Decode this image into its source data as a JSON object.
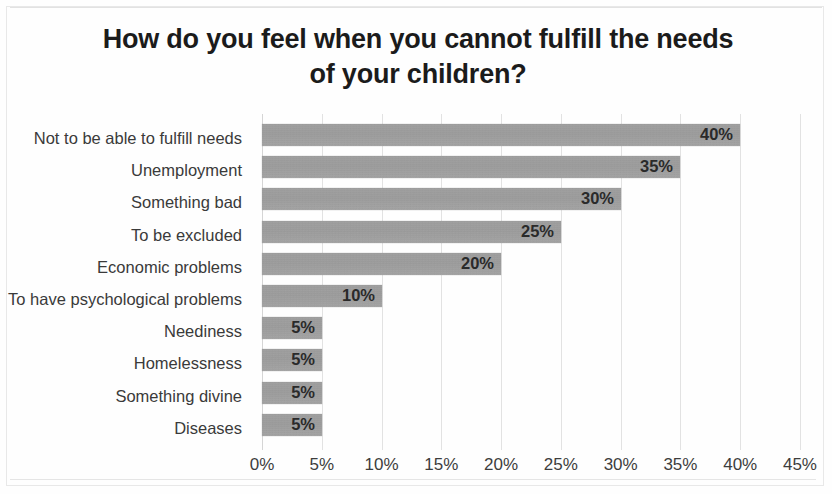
{
  "chart_data": {
    "type": "bar",
    "orientation": "horizontal",
    "title": "How do you feel when you cannot fulfill the needs of your children?",
    "title_lines": [
      "How do you feel when you cannot fulfill the needs",
      "of your children?"
    ],
    "xlabel": "",
    "ylabel": "",
    "xlim": [
      0,
      45
    ],
    "grid": true,
    "legend": false,
    "bar_color": "#9b9b9b",
    "categories": [
      "Not to be able to fulfill needs",
      "Unemployment",
      "Something bad",
      "To be excluded",
      "Economic problems",
      "To have psychological problems",
      "Neediness",
      "Homelessness",
      "Something divine",
      "Diseases"
    ],
    "values": [
      40,
      35,
      30,
      25,
      20,
      10,
      5,
      5,
      5,
      5
    ],
    "data_labels": [
      "40%",
      "35%",
      "30%",
      "25%",
      "20%",
      "10%",
      "5%",
      "5%",
      "5%",
      "5%"
    ],
    "xticks": [
      0,
      5,
      10,
      15,
      20,
      25,
      30,
      35,
      40,
      45
    ],
    "xtick_labels": [
      "0%",
      "5%",
      "10%",
      "15%",
      "20%",
      "25%",
      "30%",
      "35%",
      "40%",
      "45%"
    ]
  }
}
